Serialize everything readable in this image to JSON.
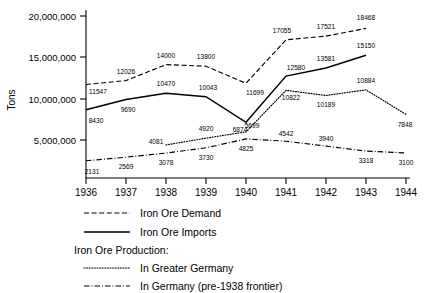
{
  "chart_data": {
    "type": "line",
    "title": "",
    "xlabel": "",
    "ylabel": "Tons",
    "x": [
      1936,
      1937,
      1938,
      1939,
      1940,
      1941,
      1942,
      1943,
      1944
    ],
    "xticklabels": [
      "1936",
      "1937",
      "1938",
      "1939",
      "1940",
      "1941",
      "1942",
      "1943",
      "1944"
    ],
    "yticks": [
      5000000,
      10000000,
      15000000,
      20000000
    ],
    "yticklabels": [
      "5,000,000",
      "10,000,000",
      "15,000,000",
      "20,000,000"
    ],
    "ylim": [
      0,
      20000000
    ],
    "xlim": [
      1936,
      1944
    ],
    "grid": false,
    "legend_position": "below-axes-left",
    "value_units": "thousands of tons",
    "series": [
      {
        "name": "Iron Ore Demand",
        "style": "dashed",
        "x": [
          1936,
          1937,
          1938,
          1939,
          1940,
          1941,
          1942,
          1943
        ],
        "values": [
          11547,
          12026,
          14000,
          13800,
          11699,
          17055,
          17521,
          18468
        ],
        "labels": [
          "11547",
          "12026",
          "14000",
          "13800",
          "11699",
          "17055",
          "17521",
          "18468"
        ]
      },
      {
        "name": "Iron Ore Imports",
        "style": "solid",
        "x": [
          1936,
          1937,
          1938,
          1939,
          1940,
          1941,
          1942,
          1943
        ],
        "values": [
          8430,
          9690,
          10470,
          10043,
          6874,
          12580,
          13581,
          15150
        ],
        "labels": [
          "8430",
          "9690",
          "10470",
          "10043",
          "6874",
          "12580",
          "13581",
          "15150"
        ]
      },
      {
        "name": "In Greater Germany",
        "style": "dotted",
        "x": [
          1938,
          1939,
          1940,
          1941,
          1942,
          1943,
          1944
        ],
        "values": [
          4081,
          4920,
          5699,
          10822,
          10189,
          10884,
          7848
        ],
        "labels": [
          "4081",
          "4920",
          "5699",
          "10822",
          "10189",
          "10884",
          "7848"
        ]
      },
      {
        "name": "In Germany (pre-1938 frontier)",
        "style": "dash-dot",
        "x": [
          1936,
          1937,
          1938,
          1939,
          1940,
          1941,
          1942,
          1943,
          1944
        ],
        "values": [
          2131,
          2569,
          3078,
          3730,
          4825,
          4542,
          3940,
          3318,
          3100
        ],
        "labels": [
          "2131",
          "2569",
          "3078",
          "3730",
          "4825",
          "4542",
          "3940",
          "3318",
          "3100"
        ]
      }
    ],
    "legend": {
      "entries": [
        {
          "label": "Iron Ore Demand",
          "style": "dashed"
        },
        {
          "label": "Iron Ore Imports",
          "style": "solid"
        }
      ],
      "group_heading": "Iron Ore Production:",
      "group_entries": [
        {
          "label": "In Greater Germany",
          "style": "dotted"
        },
        {
          "label": "In Germany (pre-1938 frontier)",
          "style": "dash-dot"
        }
      ]
    },
    "colors": {
      "line": "#000000",
      "background": "#ffffff",
      "text": "#000000"
    }
  }
}
